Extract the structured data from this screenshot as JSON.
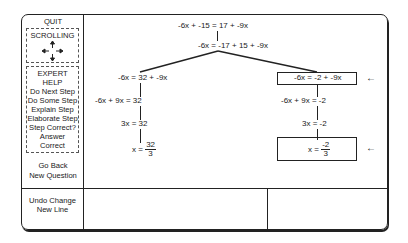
{
  "sidebar": {
    "quit": "QUIT",
    "scrolling": "SCROLLING",
    "expert": [
      "EXPERT",
      "HELP",
      "Do Next Step",
      "Do Some Step",
      "Explain Step",
      "Elaborate Step",
      "Step Correct?",
      "Answer",
      "Correct"
    ],
    "go_back": "Go Back",
    "new_question": "New Question",
    "undo_change": "Undo Change",
    "new_line": "New Line"
  },
  "tree": {
    "root": "-6x + -15 = 17 + -9x",
    "step1": "-6x = -17 + 15 + -9x",
    "left": [
      "-6x = 32 + -9x",
      "-6x + 9x = 32",
      "3x = 32"
    ],
    "left_final": {
      "lhs": "x =",
      "num": "32",
      "den": "3"
    },
    "right": [
      "-6x = -2 + -9x",
      "-6x + 9x = -2",
      "3x = -2"
    ],
    "right_final": {
      "lhs": "x =",
      "num": "-2",
      "den": "3"
    },
    "arrow": "←"
  }
}
